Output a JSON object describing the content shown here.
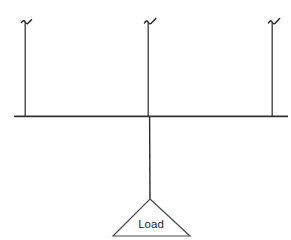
{
  "figure": {
    "clipped_top_text": "",
    "background_color": "#ffffff",
    "line_color": "#2b2b2b"
  },
  "beam": {
    "name": "horizontal-beam",
    "x_start": 14,
    "x_end": 288,
    "y": 116,
    "color": "#333333",
    "thickness": 1.6
  },
  "hangers": [
    {
      "id": "left",
      "label": "",
      "x": 25,
      "y_top": 22,
      "y_bottom": 116,
      "hook": "hook-top-icon"
    },
    {
      "id": "center",
      "label": "",
      "x": 148,
      "y_top": 22,
      "y_bottom": 116,
      "hook": "hook-top-icon"
    },
    {
      "id": "right",
      "label": "",
      "x": 272,
      "y_top": 22,
      "y_bottom": 116,
      "hook": "hook-top-icon"
    }
  ],
  "drop_line": {
    "name": "center-drop-line",
    "x": 150,
    "y_top": 116,
    "y_bottom": 199,
    "color": "#2b2b2b"
  },
  "load": {
    "label": "Load",
    "apex_x": 150,
    "apex_y": 199,
    "base_left_x": 113,
    "base_right_x": 190,
    "base_y": 236,
    "label_x": 151,
    "label_y": 228,
    "color": "#4a4a4a"
  }
}
